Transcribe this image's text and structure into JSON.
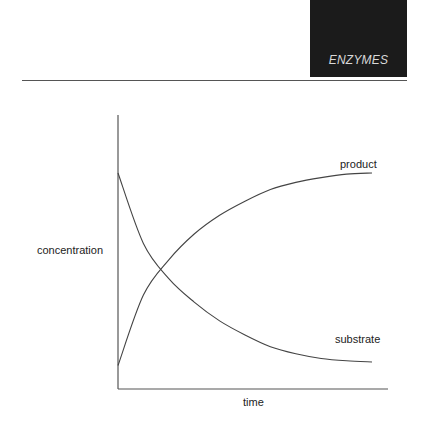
{
  "header": {
    "title": "ENZYMES",
    "box_color": "#1b1b1b",
    "text_color": "#d8d8d8"
  },
  "chart_data": {
    "type": "line",
    "title": "",
    "xlabel": "time",
    "ylabel": "concentration",
    "grid": false,
    "legend": "inline labels at line ends",
    "xlim": [
      0,
      1
    ],
    "ylim": [
      0,
      1
    ],
    "x": [
      0,
      0.1,
      0.2,
      0.3,
      0.4,
      0.5,
      0.6,
      0.7,
      0.8,
      0.9,
      1.0
    ],
    "series": [
      {
        "name": "product",
        "label": "product",
        "values": [
          0.1,
          0.4,
          0.55,
          0.66,
          0.74,
          0.8,
          0.85,
          0.88,
          0.9,
          0.915,
          0.92
        ]
      },
      {
        "name": "substrate",
        "label": "substrate",
        "values": [
          0.92,
          0.62,
          0.47,
          0.37,
          0.29,
          0.23,
          0.18,
          0.15,
          0.13,
          0.12,
          0.115
        ]
      }
    ],
    "annotations": [
      "product",
      "substrate"
    ]
  },
  "labels": {
    "product": "product",
    "substrate": "substrate",
    "ylabel": "concentration",
    "xlabel": "time"
  }
}
